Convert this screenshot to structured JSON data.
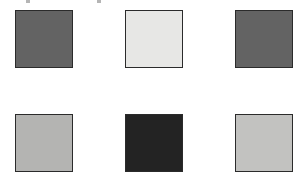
{
  "canvas": {
    "width": 304,
    "height": 181,
    "background": "#ffffff"
  },
  "grid": {
    "label": "color-swatch-grid",
    "rows": 2,
    "columns": 3,
    "border_color": "#2b2b2b",
    "swatch_width": 58,
    "swatch_height": 58,
    "column_x": [
      15,
      125,
      235
    ],
    "row_y": [
      10,
      114
    ],
    "swatches": [
      {
        "id": "swatch-1",
        "name": "swatch-row1-col1",
        "row": 1,
        "column": 1,
        "color": "#636363",
        "x": 15,
        "y": 10,
        "width": 58,
        "height": 58
      },
      {
        "id": "swatch-2",
        "name": "swatch-row1-col2",
        "row": 1,
        "column": 2,
        "color": "#e7e7e5",
        "x": 125,
        "y": 10,
        "width": 58,
        "height": 58
      },
      {
        "id": "swatch-3",
        "name": "swatch-row1-col3",
        "row": 1,
        "column": 3,
        "color": "#636363",
        "x": 235,
        "y": 10,
        "width": 58,
        "height": 58
      },
      {
        "id": "swatch-4",
        "name": "swatch-row2-col1",
        "row": 2,
        "column": 1,
        "color": "#b4b4b2",
        "x": 15,
        "y": 114,
        "width": 58,
        "height": 58
      },
      {
        "id": "swatch-5",
        "name": "swatch-row2-col2",
        "row": 2,
        "column": 2,
        "color": "#232323",
        "x": 125,
        "y": 114,
        "width": 58,
        "height": 58
      },
      {
        "id": "swatch-6",
        "name": "swatch-row2-col3",
        "row": 2,
        "column": 3,
        "color": "#c2c2c0",
        "x": 235,
        "y": 114,
        "width": 58,
        "height": 58
      }
    ]
  },
  "top_edge_artifacts": {
    "description": "cropped-text-remnants",
    "items": [
      {
        "name": "artifact-left",
        "x": 26,
        "y": 0,
        "width": 4,
        "height": 3
      },
      {
        "name": "artifact-right",
        "x": 97,
        "y": 0,
        "width": 4,
        "height": 3
      }
    ]
  }
}
